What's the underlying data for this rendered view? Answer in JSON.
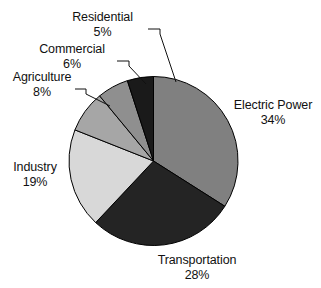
{
  "chart_data": {
    "type": "pie",
    "title": "",
    "subtitle": "",
    "xlabel": "",
    "ylabel": "",
    "legend_position": "none",
    "grid": false,
    "units": "percent",
    "start_angle_deg": 0,
    "direction": "clockwise",
    "categories": [
      "Electric Power",
      "Transportation",
      "Industry",
      "Agriculture",
      "Commercial",
      "Residential"
    ],
    "values": [
      34,
      28,
      19,
      8,
      6,
      5
    ],
    "colors": [
      "#808080",
      "#242424",
      "#d8d8d8",
      "#a6a6a6",
      "#8f8f8f",
      "#1a1a1a"
    ],
    "slices": [
      {
        "name": "Electric Power",
        "value": 34,
        "percent_text": "34%",
        "color": "#808080",
        "label_text": "Electric Power",
        "leader": false
      },
      {
        "name": "Transportation",
        "value": 28,
        "percent_text": "28%",
        "color": "#242424",
        "label_text": "Transportation",
        "leader": false
      },
      {
        "name": "Industry",
        "value": 19,
        "percent_text": "19%",
        "color": "#d8d8d8",
        "label_text": "Industry",
        "leader": false
      },
      {
        "name": "Agriculture",
        "value": 8,
        "percent_text": "8%",
        "color": "#a6a6a6",
        "label_text": "Agriculture",
        "leader": true
      },
      {
        "name": "Commercial",
        "value": 6,
        "percent_text": "6%",
        "color": "#8f8f8f",
        "label_text": "Commercial",
        "leader": true
      },
      {
        "name": "Residential",
        "value": 5,
        "percent_text": "5%",
        "color": "#1a1a1a",
        "label_text": "Residential",
        "leader": true
      }
    ]
  },
  "labels": {
    "electric_power": {
      "name": "Electric Power",
      "percent": "34%"
    },
    "transportation": {
      "name": "Transportation",
      "percent": "28%"
    },
    "industry": {
      "name": "Industry",
      "percent": "19%"
    },
    "agriculture": {
      "name": "Agriculture",
      "percent": "8%"
    },
    "commercial": {
      "name": "Commercial",
      "percent": "6%"
    },
    "residential": {
      "name": "Residential",
      "percent": "5%"
    }
  },
  "colors": {
    "background": "#ffffff",
    "text": "#111111",
    "slice_outline": "#000000",
    "leader_line": "#111111"
  }
}
